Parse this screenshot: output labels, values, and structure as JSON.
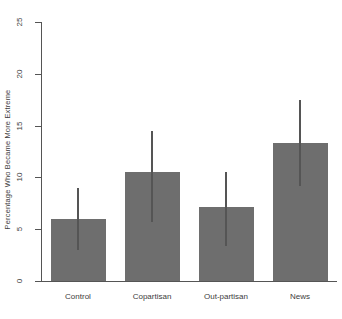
{
  "chart_data": {
    "type": "bar",
    "title": "",
    "xlabel": "",
    "ylabel": "Percentage Who Became More Extreme",
    "categories": [
      "Control",
      "Copartisan",
      "Out-partisan",
      "News"
    ],
    "values": [
      6.0,
      10.5,
      7.1,
      13.3
    ],
    "error_low": [
      3.0,
      5.7,
      3.4,
      9.2
    ],
    "error_high": [
      9.0,
      14.5,
      10.5,
      17.5
    ],
    "ylim": [
      0,
      25
    ],
    "yticks": [
      0,
      5,
      10,
      15,
      20,
      25
    ],
    "ytick_labels": [
      "0",
      "5",
      "10",
      "15",
      "20",
      "25"
    ],
    "grid": false,
    "legend": null,
    "bar_color": "#6e6e6e",
    "axis_color": "#555555",
    "background": "#ffffff"
  }
}
